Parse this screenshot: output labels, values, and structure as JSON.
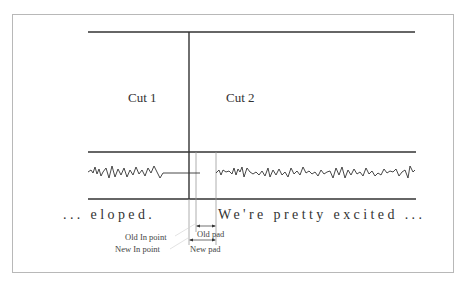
{
  "diagram": {
    "cuts": [
      {
        "label": "Cut 1"
      },
      {
        "label": "Cut 2"
      }
    ],
    "transcript": {
      "before": "... eloped.",
      "after": "We're pretty excited ..."
    },
    "annotations": {
      "old_in_point": "Old In point",
      "new_in_point": "New In point",
      "old_pad": "Old pad",
      "new_pad": "New pad"
    },
    "colors": {
      "line": "#333333",
      "thin_line": "#9a9a9a",
      "frame": "#b8b8b8"
    }
  }
}
